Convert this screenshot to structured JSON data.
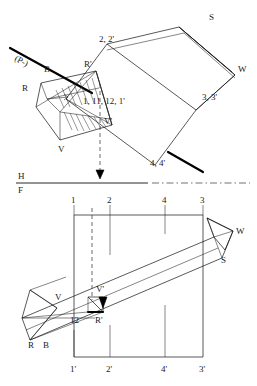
{
  "drawing": {
    "title": "Descriptive geometry: two-view orthographic projection of an oblique prism cut by a plane",
    "reference_line": {
      "upper_label": "H",
      "lower_label": "F"
    },
    "top_view": {
      "name": "horizontal-projection",
      "labels": {
        "plane_trace": "(P-)",
        "b": "B",
        "r": "R",
        "r_prime": "R'",
        "v": "V",
        "v_prime": "V'",
        "point_2": "2, 2'",
        "point_3": "3, 3'",
        "point_4": "4, 4'",
        "edge_group": "1, 11, 12, 1'",
        "s": "S",
        "w": "W"
      }
    },
    "front_view": {
      "name": "frontal-projection",
      "top_station_labels": [
        "1",
        "2",
        "4",
        "3"
      ],
      "bottom_station_labels": [
        "1'",
        "2'",
        "4'",
        "3'"
      ],
      "labels": {
        "r": "R",
        "b": "B",
        "r_prime": "R'",
        "v": "V",
        "v_prime": "V'",
        "point_12": "12",
        "s": "S",
        "w": "W"
      }
    },
    "colors": {
      "line": "#111111",
      "background": "#ffffff",
      "heavy": "#000000"
    }
  }
}
